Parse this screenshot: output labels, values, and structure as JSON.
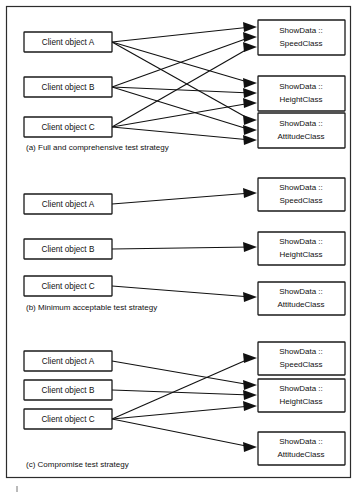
{
  "figure": {
    "caption_a": "(a) Full and comprehensive test strategy",
    "caption_b": "(b) Minimum acceptable test strategy",
    "caption_c": "(c) Compromise test strategy",
    "border_color": "#2c2c2c",
    "box_color": "#ffffff",
    "line_color": "#111111"
  },
  "labels": {
    "client_a": "Client object A",
    "client_b": "Client object B",
    "client_c": "Client object C",
    "server_speed_line1": "ShowData ::",
    "server_speed_line2": "SpeedClass",
    "server_height_line1": "ShowData ::",
    "server_height_line2": "HeightClass",
    "server_attitude_line1": "ShowData ::",
    "server_attitude_line2": "AttitudeClass"
  },
  "sections": [
    {
      "id": "a",
      "caption": "(a) Full and comprehensive test strategy",
      "clients": [
        "Client object A",
        "Client object B",
        "Client object C"
      ],
      "servers": [
        "ShowData :: SpeedClass",
        "ShowData :: HeightClass",
        "ShowData :: AttitudeClass"
      ],
      "edges": [
        {
          "from": "Client object A",
          "to": "ShowData :: SpeedClass"
        },
        {
          "from": "Client object A",
          "to": "ShowData :: HeightClass"
        },
        {
          "from": "Client object A",
          "to": "ShowData :: AttitudeClass"
        },
        {
          "from": "Client object B",
          "to": "ShowData :: SpeedClass"
        },
        {
          "from": "Client object B",
          "to": "ShowData :: HeightClass"
        },
        {
          "from": "Client object B",
          "to": "ShowData :: AttitudeClass"
        },
        {
          "from": "Client object C",
          "to": "ShowData :: SpeedClass"
        },
        {
          "from": "Client object C",
          "to": "ShowData :: HeightClass"
        },
        {
          "from": "Client object C",
          "to": "ShowData :: AttitudeClass"
        }
      ],
      "edge_count": 9
    },
    {
      "id": "b",
      "caption": "(b) Minimum acceptable test strategy",
      "clients": [
        "Client object A",
        "Client object B",
        "Client object C"
      ],
      "servers": [
        "ShowData :: SpeedClass",
        "ShowData :: HeightClass",
        "ShowData :: AttitudeClass"
      ],
      "edges": [
        {
          "from": "Client object A",
          "to": "ShowData :: SpeedClass"
        },
        {
          "from": "Client object B",
          "to": "ShowData :: HeightClass"
        },
        {
          "from": "Client object C",
          "to": "ShowData :: AttitudeClass"
        }
      ],
      "edge_count": 3
    },
    {
      "id": "c",
      "caption": "(c) Compromise test strategy",
      "clients": [
        "Client object A",
        "Client object B",
        "Client object C"
      ],
      "servers": [
        "ShowData :: SpeedClass",
        "ShowData :: HeightClass",
        "ShowData :: AttitudeClass"
      ],
      "edges": [
        {
          "from": "Client object A",
          "to": "ShowData :: HeightClass"
        },
        {
          "from": "Client object B",
          "to": "ShowData :: HeightClass"
        },
        {
          "from": "Client object C",
          "to": "ShowData :: SpeedClass"
        },
        {
          "from": "Client object C",
          "to": "ShowData :: HeightClass"
        },
        {
          "from": "Client object C",
          "to": "ShowData :: AttitudeClass"
        }
      ],
      "edge_count": 5
    }
  ]
}
